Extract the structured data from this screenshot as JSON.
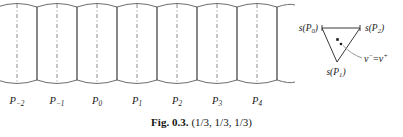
{
  "figure": {
    "caption_label": "Fig. 0.3.",
    "caption_value": "(1/3, 1/3, 1/3)",
    "colors": {
      "solid_line": "#3a3a3a",
      "dashed_line": "#8c8c8c",
      "arc_line": "#6e6e6e",
      "triangle_line": "#3a3a3a",
      "background": "#ffffff",
      "text": "#1a1a1a"
    }
  },
  "tube_diagram": {
    "name": "periodic-tube-chain",
    "segment_count": 7,
    "axis_labels": [
      {
        "base": "P",
        "sub": "−2",
        "text": "P₋₂",
        "x": 17
      },
      {
        "base": "P",
        "sub": "−1",
        "text": "P₋₁",
        "x": 57
      },
      {
        "base": "P",
        "sub": "0",
        "text": "P₀",
        "x": 97
      },
      {
        "base": "P",
        "sub": "1",
        "text": "P₁",
        "x": 137
      },
      {
        "base": "P",
        "sub": "2",
        "text": "P₂",
        "x": 177
      },
      {
        "base": "P",
        "sub": "3",
        "text": "P₃",
        "x": 217
      },
      {
        "base": "P",
        "sub": "4",
        "text": "P₄",
        "x": 257
      }
    ],
    "dashed_axis_x": [
      17,
      57,
      97,
      137,
      177,
      217,
      257
    ],
    "solid_boundary_x": [
      37,
      77,
      117,
      157,
      197,
      237,
      277
    ],
    "top_y": 7,
    "bottom_y": 80,
    "bulge": 7
  },
  "triangle_diagram": {
    "name": "spherical-triangle",
    "vertices": [
      {
        "id": "s-p0",
        "label_base": "s",
        "label_arg": "P",
        "label_sub": "0",
        "text": "s(P₀)",
        "x": 322,
        "y": 28
      },
      {
        "id": "s-p2",
        "label_base": "s",
        "label_arg": "P",
        "label_sub": "2",
        "text": "s(P₂)",
        "x": 360,
        "y": 28
      },
      {
        "id": "s-p1",
        "label_base": "s",
        "label_arg": "P",
        "label_sub": "1",
        "text": "s(P₁)",
        "x": 337,
        "y": 62
      }
    ],
    "interior_points": [
      {
        "id": "nu-minus",
        "x": 337.5,
        "y": 39.5
      },
      {
        "id": "nu-plus",
        "x": 341.0,
        "y": 44.0
      }
    ],
    "annotation": {
      "text": "ν⁻ = ν⁺",
      "nu_minus": "ν",
      "minus_sup": "−",
      "equals": "=",
      "nu_plus": "ν",
      "plus_sup": "+",
      "x": 364,
      "y": 62
    }
  }
}
